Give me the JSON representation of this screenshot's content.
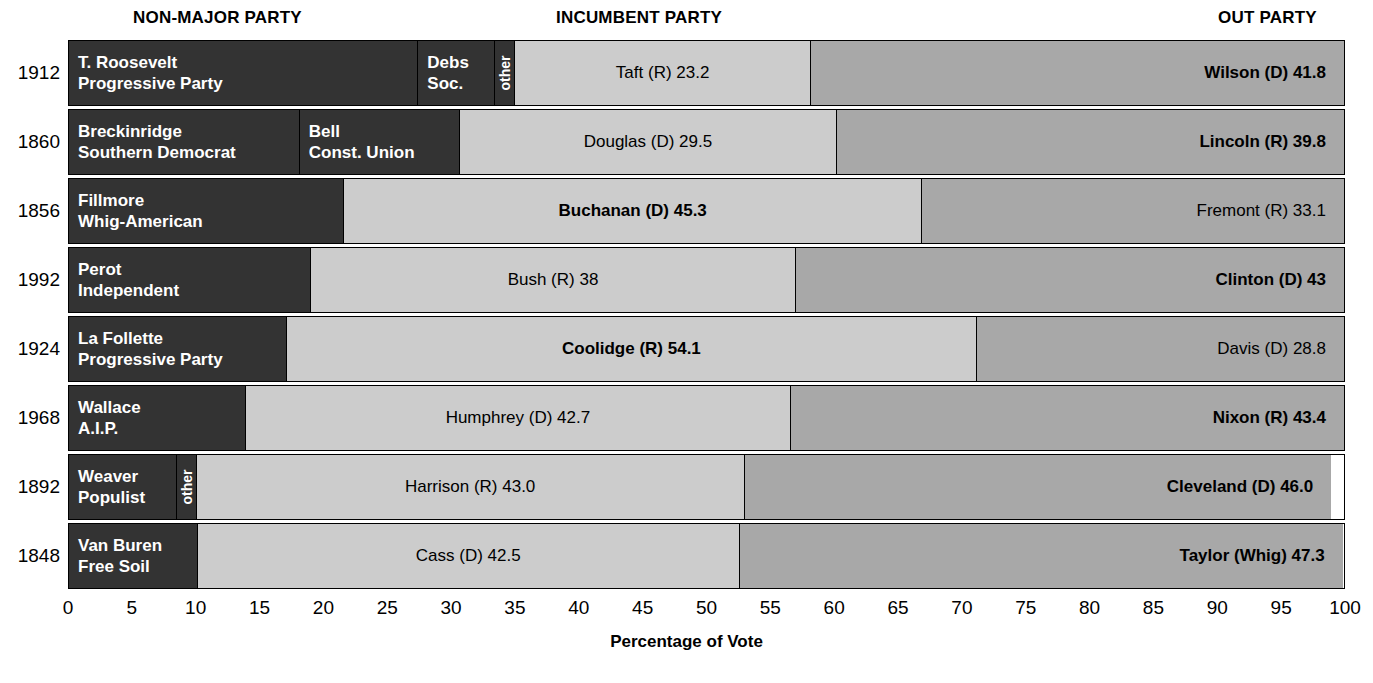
{
  "header": {
    "nonmajor": "NON-MAJOR PARTY",
    "incumbent": "INCUMBENT PARTY",
    "out": "OUT PARTY"
  },
  "axis": {
    "title": "Percentage of Vote",
    "ticks": [
      "0",
      "5",
      "10",
      "15",
      "20",
      "25",
      "30",
      "35",
      "40",
      "45",
      "50",
      "55",
      "60",
      "65",
      "70",
      "75",
      "80",
      "85",
      "90",
      "95",
      "100"
    ],
    "min": 0,
    "max": 100
  },
  "colors": {
    "nonmajor": "#333333",
    "incumbent": "#cccccc",
    "out": "#a8a8a8",
    "border": "#000000",
    "background": "#ffffff"
  },
  "chart_data": {
    "type": "bar",
    "subtype": "stacked-horizontal",
    "title": "",
    "xlabel": "Percentage of Vote",
    "ylabel": "",
    "xlim": [
      0,
      100
    ],
    "grid": false,
    "legend": [
      "NON-MAJOR PARTY",
      "INCUMBENT PARTY",
      "OUT PARTY"
    ],
    "categories": [
      "1912",
      "1860",
      "1856",
      "1992",
      "1924",
      "1968",
      "1892",
      "1848"
    ],
    "rows": [
      {
        "year": "1912",
        "segments": [
          {
            "kind": "nonmajor",
            "value": 27.4,
            "label_style": "stack",
            "line1": "T. Roosevelt",
            "line2": "Progressive Party"
          },
          {
            "kind": "nonmajor",
            "value": 6.0,
            "label_style": "stack",
            "line1": "Debs",
            "line2": "Soc."
          },
          {
            "kind": "nonmajor",
            "value": 1.6,
            "label_style": "vertical",
            "line1": "other",
            "line2": ""
          },
          {
            "kind": "incumbent",
            "value": 23.2,
            "label_style": "center",
            "line1": "Taft (R) 23.2",
            "line2": "",
            "bold": false
          },
          {
            "kind": "out",
            "value": 41.8,
            "label_style": "right",
            "line1": "Wilson (D) 41.8",
            "line2": "",
            "bold": true
          }
        ]
      },
      {
        "year": "1860",
        "segments": [
          {
            "kind": "nonmajor",
            "value": 18.1,
            "label_style": "stack",
            "line1": "Breckinridge",
            "line2": "Southern Democrat"
          },
          {
            "kind": "nonmajor",
            "value": 12.6,
            "label_style": "stack",
            "line1": "Bell",
            "line2": "Const. Union"
          },
          {
            "kind": "incumbent",
            "value": 29.5,
            "label_style": "center",
            "line1": "Douglas (D) 29.5",
            "line2": "",
            "bold": false
          },
          {
            "kind": "out",
            "value": 39.8,
            "label_style": "right",
            "line1": "Lincoln (R) 39.8",
            "line2": "",
            "bold": true
          }
        ]
      },
      {
        "year": "1856",
        "segments": [
          {
            "kind": "nonmajor",
            "value": 21.6,
            "label_style": "stack",
            "line1": "Fillmore",
            "line2": "Whig-American"
          },
          {
            "kind": "incumbent",
            "value": 45.3,
            "label_style": "center",
            "line1": "Buchanan (D) 45.3",
            "line2": "",
            "bold": true
          },
          {
            "kind": "out",
            "value": 33.1,
            "label_style": "right",
            "line1": "Fremont (R) 33.1",
            "line2": "",
            "bold": false
          }
        ]
      },
      {
        "year": "1992",
        "segments": [
          {
            "kind": "nonmajor",
            "value": 19.0,
            "label_style": "stack",
            "line1": "Perot",
            "line2": "Independent"
          },
          {
            "kind": "incumbent",
            "value": 38.0,
            "label_style": "center",
            "line1": "Bush (R) 38",
            "line2": "",
            "bold": false
          },
          {
            "kind": "out",
            "value": 43.0,
            "label_style": "right",
            "line1": "Clinton (D) 43",
            "line2": "",
            "bold": true
          }
        ]
      },
      {
        "year": "1924",
        "segments": [
          {
            "kind": "nonmajor",
            "value": 17.1,
            "label_style": "stack",
            "line1": "La Follette",
            "line2": "Progressive Party"
          },
          {
            "kind": "incumbent",
            "value": 54.1,
            "label_style": "center",
            "line1": "Coolidge (R) 54.1",
            "line2": "",
            "bold": true
          },
          {
            "kind": "out",
            "value": 28.8,
            "label_style": "right",
            "line1": "Davis (D) 28.8",
            "line2": "",
            "bold": false
          }
        ]
      },
      {
        "year": "1968",
        "segments": [
          {
            "kind": "nonmajor",
            "value": 13.9,
            "label_style": "stack",
            "line1": "Wallace",
            "line2": "A.I.P."
          },
          {
            "kind": "incumbent",
            "value": 42.7,
            "label_style": "center",
            "line1": "Humphrey (D) 42.7",
            "line2": "",
            "bold": false
          },
          {
            "kind": "out",
            "value": 43.4,
            "label_style": "right",
            "line1": "Nixon (R) 43.4",
            "line2": "",
            "bold": true
          }
        ]
      },
      {
        "year": "1892",
        "segments": [
          {
            "kind": "nonmajor",
            "value": 8.5,
            "label_style": "stack",
            "line1": "Weaver",
            "line2": "Populist"
          },
          {
            "kind": "nonmajor",
            "value": 1.5,
            "label_style": "vertical",
            "line1": "other",
            "line2": ""
          },
          {
            "kind": "incumbent",
            "value": 43.0,
            "label_style": "center",
            "line1": "Harrison (R) 43.0",
            "line2": "",
            "bold": false
          },
          {
            "kind": "out",
            "value": 46.0,
            "label_style": "right",
            "line1": "Cleveland (D) 46.0",
            "line2": "",
            "bold": true
          }
        ]
      },
      {
        "year": "1848",
        "segments": [
          {
            "kind": "nonmajor",
            "value": 10.1,
            "label_style": "stack",
            "line1": "Van Buren",
            "line2": "Free Soil"
          },
          {
            "kind": "incumbent",
            "value": 42.5,
            "label_style": "center",
            "line1": "Cass (D) 42.5",
            "line2": "",
            "bold": false
          },
          {
            "kind": "out",
            "value": 47.3,
            "label_style": "right",
            "line1": "Taylor (Whig) 47.3",
            "line2": "",
            "bold": true
          }
        ]
      }
    ]
  }
}
